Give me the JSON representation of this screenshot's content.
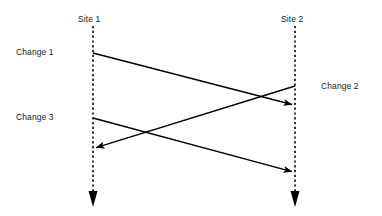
{
  "diagram": {
    "type": "sequence-diagram",
    "background_color": "#ffffff",
    "line_color": "#000000",
    "text_color": "#1a1a1a",
    "lifelines": [
      {
        "id": "site1",
        "label": "Site 1",
        "x": 93,
        "label_x": 78,
        "label_y": 14,
        "top": 26,
        "bottom": 206
      },
      {
        "id": "site2",
        "label": "Site 2",
        "x": 295,
        "label_x": 281,
        "label_y": 14,
        "top": 26,
        "bottom": 206
      }
    ],
    "messages": [
      {
        "id": "change1",
        "label": "Change 1",
        "label_x": 16,
        "label_y": 47,
        "from": "site1",
        "to": "site2",
        "x1": 93,
        "y1": 53,
        "x2": 293,
        "y2": 105,
        "direction": "left-to-right"
      },
      {
        "id": "change2",
        "label": "Change 2",
        "label_x": 321,
        "label_y": 81,
        "from": "site2",
        "to": "site1",
        "x1": 295,
        "y1": 86,
        "x2": 95,
        "y2": 148,
        "direction": "right-to-left"
      },
      {
        "id": "change3",
        "label": "Change 3",
        "label_x": 16,
        "label_y": 112,
        "from": "site1",
        "to": "site2",
        "x1": 93,
        "y1": 118,
        "x2": 293,
        "y2": 172,
        "direction": "left-to-right"
      }
    ]
  }
}
